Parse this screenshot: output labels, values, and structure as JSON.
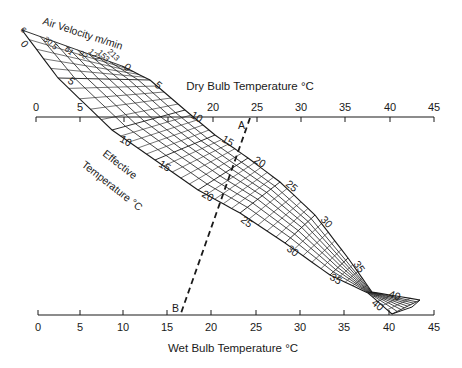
{
  "diagram": {
    "top_axis": {
      "label": "Dry Bulb Temperature °C",
      "ticks": [
        "0",
        "5",
        "20",
        "25",
        "30",
        "35",
        "40",
        "45"
      ]
    },
    "bottom_axis": {
      "label": "Wet Bulb Temperature °C",
      "ticks": [
        "0",
        "5",
        "10",
        "15",
        "20",
        "25",
        "30",
        "35",
        "40",
        "45"
      ]
    },
    "velocity": {
      "label": "Air Velocity m/min",
      "values": [
        "6",
        "30.5",
        "61",
        "92",
        "122",
        "153",
        "213"
      ]
    },
    "effective_temperature": {
      "label_line1": "Effective",
      "label_line2": "Temperature °C",
      "upper_edge_labels": [
        "0",
        "5",
        "10",
        "15",
        "20",
        "25",
        "30",
        "35",
        "40"
      ],
      "lower_edge_labels": [
        "0",
        "5",
        "10",
        "15",
        "20",
        "25",
        "30",
        "35",
        "40"
      ]
    },
    "line": {
      "point_a": "A",
      "point_b": "B",
      "dry_bulb": 24,
      "wet_bulb": 17
    }
  }
}
